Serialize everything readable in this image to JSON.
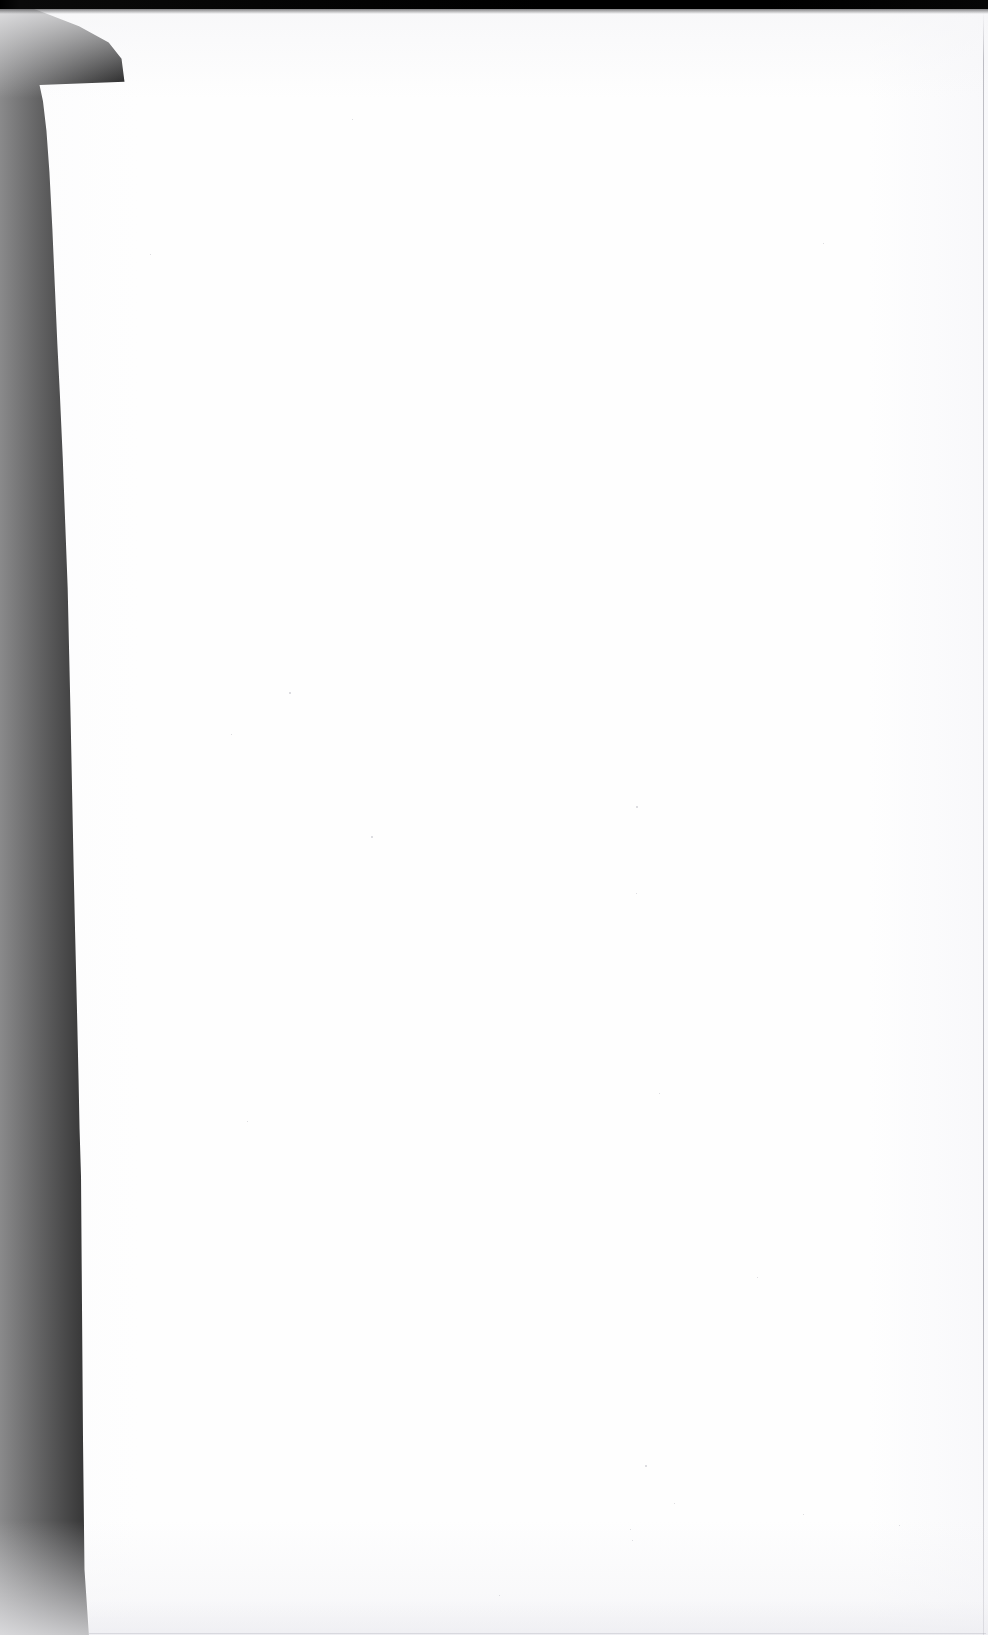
{
  "document": {
    "kind": "scanned-page",
    "page_label": "",
    "body_text": "",
    "is_blank": true,
    "orientation": "portrait"
  },
  "canvas": {
    "width_px": 988,
    "height_px": 1635
  },
  "colors": {
    "scan_void": "#010101",
    "paper": "#fefefe",
    "top_bar": "#000000",
    "page_edge_rule": "#8c8c96",
    "bottom_wash": "#eeeef2",
    "speck": "#b0b0ba"
  },
  "regions": {
    "scan_void_label": "",
    "paper_label": "",
    "top_edge_label": "",
    "right_edge_label": "",
    "bottom_wash_label": ""
  },
  "specks": [
    {
      "x": 289,
      "y": 692,
      "size": 2
    },
    {
      "x": 231,
      "y": 734,
      "size": 1
    },
    {
      "x": 371,
      "y": 836,
      "size": 2
    },
    {
      "x": 636,
      "y": 806,
      "size": 2
    },
    {
      "x": 636,
      "y": 893,
      "size": 1
    },
    {
      "x": 659,
      "y": 1093,
      "size": 1
    },
    {
      "x": 645,
      "y": 1465,
      "size": 2
    },
    {
      "x": 630,
      "y": 1529,
      "size": 1
    },
    {
      "x": 632,
      "y": 1540,
      "size": 1
    },
    {
      "x": 674,
      "y": 1503,
      "size": 1
    },
    {
      "x": 803,
      "y": 1514,
      "size": 1
    },
    {
      "x": 899,
      "y": 1525,
      "size": 1
    },
    {
      "x": 352,
      "y": 119,
      "size": 1
    },
    {
      "x": 823,
      "y": 243,
      "size": 1
    },
    {
      "x": 150,
      "y": 254,
      "size": 1
    },
    {
      "x": 499,
      "y": 1595,
      "size": 1
    },
    {
      "x": 247,
      "y": 1121,
      "size": 1
    },
    {
      "x": 757,
      "y": 1277,
      "size": 1
    }
  ]
}
